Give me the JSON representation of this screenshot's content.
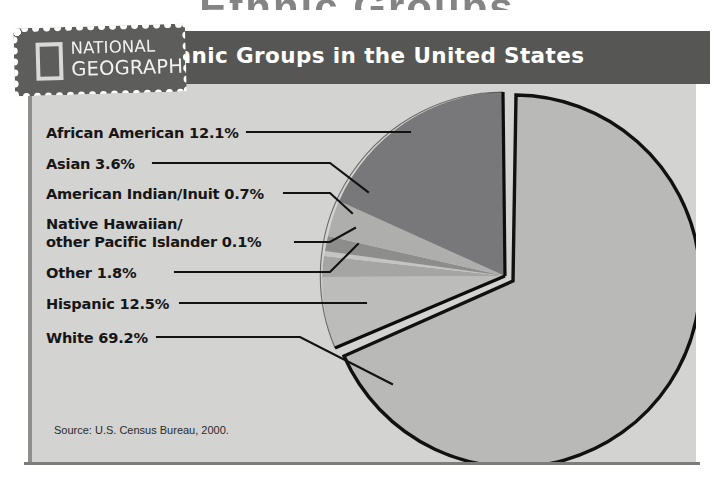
{
  "page": {
    "bleed_text": "Ethnic Groups",
    "source_note": "Source: U.S. Census Bureau, 2000."
  },
  "logo": {
    "name": "national-geographic",
    "line1": "NATIONAL",
    "line2": "GEOGRAPHIC"
  },
  "header": {
    "title": "Ethnic Groups in the United States"
  },
  "colors": {
    "panel_bg": "#d3d3d1",
    "title_bar": "#565654",
    "logo_bg": "#5d5d5b",
    "slice_dark": "#787876",
    "slice_mid": "#9a9a98",
    "slice_light": "#b9b9b7",
    "slice_pale": "#c6c6c4",
    "outline": "#111111",
    "text": "#161616"
  },
  "chart_data": {
    "type": "pie",
    "title": "Ethnic Groups in the United States",
    "source": "Source: U.S. Census Bureau, 2000.",
    "unit": "percent",
    "legend_position": "left-callouts",
    "total": 100.0,
    "labels": [
      "African American 12.1%",
      "Asian 3.6%",
      "American Indian/Inuit 0.7%",
      "Native Hawaiian/ other Pacific Islander 0.1%",
      "Other 1.8%",
      "Hispanic 12.5%",
      "White 69.2%"
    ],
    "categories": [
      "African American",
      "Asian",
      "American Indian/Inuit",
      "Native Hawaiian/other Pacific Islander",
      "Other",
      "Hispanic",
      "White"
    ],
    "values": [
      12.1,
      3.6,
      0.7,
      0.1,
      1.8,
      12.5,
      69.2
    ],
    "slices": [
      {
        "name": "African American",
        "value": 12.1,
        "label": "African American 12.1%",
        "color": "#787876",
        "exploded": false
      },
      {
        "name": "Asian",
        "value": 3.6,
        "label": "Asian 3.6%",
        "color": "#a9a9a7",
        "exploded": false
      },
      {
        "name": "American Indian/Inuit",
        "value": 0.7,
        "label": "American Indian/Inuit 0.7%",
        "color": "#8b8b89",
        "exploded": false
      },
      {
        "name": "Native Hawaiian/other Pacific Islander",
        "value": 0.1,
        "label": "Native Hawaiian/ other Pacific Islander 0.1%",
        "color": "#c2c2c0",
        "exploded": false
      },
      {
        "name": "Other",
        "value": 1.8,
        "label": "Other 1.8%",
        "color": "#8f8f8d",
        "exploded": false
      },
      {
        "name": "Hispanic",
        "value": 12.5,
        "label": "Hispanic 12.5%",
        "color": "#b9b9b7",
        "exploded": false
      },
      {
        "name": "White",
        "value": 69.2,
        "label": "White 69.2%",
        "color": "#b9b9b7",
        "exploded": true
      }
    ]
  },
  "callouts": [
    {
      "id": "african-american",
      "line1": "African American 12.1%",
      "line2": ""
    },
    {
      "id": "asian",
      "line1": "Asian 3.6%",
      "line2": ""
    },
    {
      "id": "american-indian-inuit",
      "line1": "American Indian/Inuit 0.7%",
      "line2": ""
    },
    {
      "id": "native-hawaiian",
      "line1": "Native Hawaiian/",
      "line2": "other Pacific Islander 0.1%"
    },
    {
      "id": "other",
      "line1": "Other 1.8%",
      "line2": ""
    },
    {
      "id": "hispanic",
      "line1": "Hispanic 12.5%",
      "line2": ""
    },
    {
      "id": "white",
      "line1": "White 69.2%",
      "line2": ""
    }
  ]
}
